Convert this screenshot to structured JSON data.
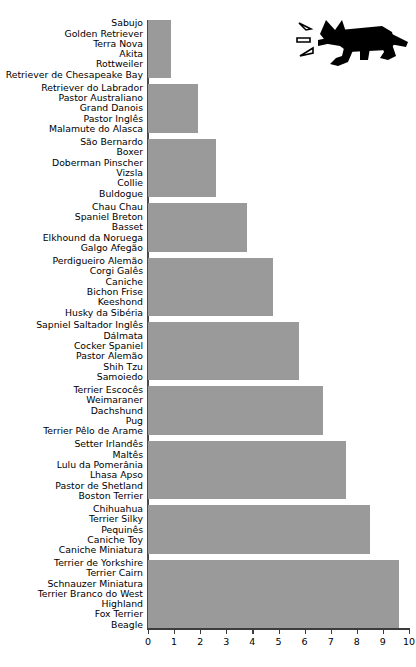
{
  "chart_data": {
    "type": "bar",
    "orientation": "horizontal",
    "title": "",
    "subtitle": "",
    "xlabel": "",
    "ylabel": "",
    "xlim": [
      0,
      10
    ],
    "grid": false,
    "legend": null,
    "bar_color": "#9a9a9a",
    "axis_color": "#3c3c3c",
    "xticks": [
      "0",
      "1",
      "2",
      "3",
      "4",
      "5",
      "6",
      "7",
      "8",
      "9",
      "10"
    ],
    "xtick_values": [
      0,
      1,
      2,
      3,
      4,
      5,
      6,
      7,
      8,
      9,
      10
    ],
    "categories": [
      "Sabujo / Golden Retriever / Terra Nova / Akita / Rottweiler / Retriever de Chesapeake Bay",
      "Retriever do Labrador / Pastor Australiano / Grand Danois / Pastor Inglês / Malamute do Alasca",
      "São Bernardo / Boxer / Doberman Pinscher / Vizsla / Collie / Buldogue",
      "Chau Chau / Spaniel Breton / Basset / Elkhound da Noruega / Galgo Afegão",
      "Perdigueiro Alemão / Corgi Galês / Caniche / Bichon Frise / Keeshond / Husky da Sibéria",
      "Sapniel Saltador Inglês / Dálmata / Cocker Spaniel / Pastor Alemão / Shih Tzu / Samoiedo",
      "Terrier Escocês / Weimaraner / Dachshund / Pug / Terrier Pêlo de Arame",
      "Setter Irlandês / Maltês / Lulu da Pomerânia / Lhasa Apso / Pastor de Shetland / Boston Terrier",
      "Chihuahua / Terrier Silky / Pequinês / Caniche Toy / Caniche Miniatura",
      "Terrier de Yorkshire / Terrier Cairn / Schnauzer Miniatura / Terrier Branco do West Highland / Fox Terrier / Beagle"
    ],
    "values": [
      0.9,
      1.9,
      2.6,
      3.8,
      4.8,
      5.8,
      6.7,
      7.6,
      8.5,
      9.6
    ],
    "groups": [
      {
        "value": 0.9,
        "breeds": [
          "Sabujo",
          "Golden Retriever",
          "Terra Nova",
          "Akita",
          "Rottweiler",
          "Retriever de Chesapeake Bay"
        ]
      },
      {
        "value": 1.9,
        "breeds": [
          "Retriever do Labrador",
          "Pastor Australiano",
          "Grand Danois",
          "Pastor Inglês",
          "Malamute do Alasca"
        ]
      },
      {
        "value": 2.6,
        "breeds": [
          "São Bernardo",
          "Boxer",
          "Doberman Pinscher",
          "Vizsla",
          "Collie",
          "Buldogue"
        ]
      },
      {
        "value": 3.8,
        "breeds": [
          "Chau Chau",
          "Spaniel Breton",
          "Basset",
          "Elkhound da Noruega",
          "Galgo Afegão"
        ]
      },
      {
        "value": 4.8,
        "breeds": [
          "Perdigueiro Alemão",
          "Corgi Galês",
          "Caniche",
          "Bichon Frise",
          "Keeshond",
          "Husky da Sibéria"
        ]
      },
      {
        "value": 5.8,
        "breeds": [
          "Sapniel Saltador Inglês",
          "Dálmata",
          "Cocker Spaniel",
          "Pastor Alemão",
          "Shih Tzu",
          "Samoiedo"
        ]
      },
      {
        "value": 6.7,
        "breeds": [
          "Terrier Escocês",
          "Weimaraner",
          "Dachshund",
          "Pug",
          "Terrier Pêlo de Arame"
        ]
      },
      {
        "value": 7.6,
        "breeds": [
          "Setter Irlandês",
          "Maltês",
          "Lulu da Pomerânia",
          "Lhasa Apso",
          "Pastor de Shetland",
          "Boston Terrier"
        ]
      },
      {
        "value": 8.5,
        "breeds": [
          "Chihuahua",
          "Terrier Silky",
          "Pequinês",
          "Caniche Toy",
          "Caniche Miniatura"
        ]
      },
      {
        "value": 9.6,
        "breeds": [
          "Terrier de Yorkshire",
          "Terrier Cairn",
          "Schnauzer Miniatura",
          "Terrier Branco do West",
          "Highland",
          "Fox Terrier",
          "Beagle"
        ]
      }
    ]
  },
  "illustration": {
    "name": "barking-dog-silhouette",
    "color": "#000000"
  }
}
